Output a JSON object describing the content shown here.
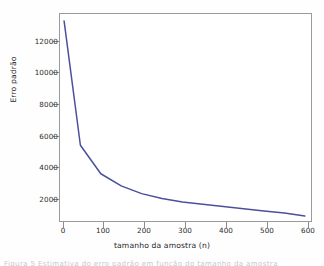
{
  "chart_data": {
    "type": "line",
    "title": "",
    "xlabel": "tamanho da amostra (n)",
    "ylabel": "Erro padrão",
    "xlim": [
      0,
      620
    ],
    "ylim": [
      1300,
      13400
    ],
    "xticks": [
      0,
      100,
      200,
      300,
      400,
      500,
      600
    ],
    "xticklabels": [
      "0",
      "100",
      "200",
      "300",
      "400",
      "500",
      "600"
    ],
    "yticks": [
      2000,
      4000,
      6000,
      8000,
      10000,
      12000
    ],
    "yticklabels": [
      "2000",
      "4000",
      "6000",
      "8000",
      "10000",
      "12000"
    ],
    "grid": false,
    "legend": false,
    "series": [
      {
        "name": "erro padrao",
        "color": "#4b509b",
        "x": [
          10,
          50,
          100,
          150,
          200,
          250,
          300,
          350,
          400,
          450,
          500,
          550,
          600
        ],
        "values": [
          13000,
          5800,
          4150,
          3450,
          3000,
          2720,
          2520,
          2380,
          2250,
          2120,
          2000,
          1880,
          1700
        ]
      }
    ]
  },
  "axes": {
    "y_title": "Erro padrão",
    "x_title": "tamanho da amostra (n)"
  },
  "caption": {
    "sliver_text": "Figura 5 Estimativa do erro padrão em função do tamanho da amostra"
  },
  "colors": {
    "line": "#4b509b",
    "frame": "#9a9a9a",
    "text": "#2b2b2b",
    "background": "#ffffff"
  }
}
